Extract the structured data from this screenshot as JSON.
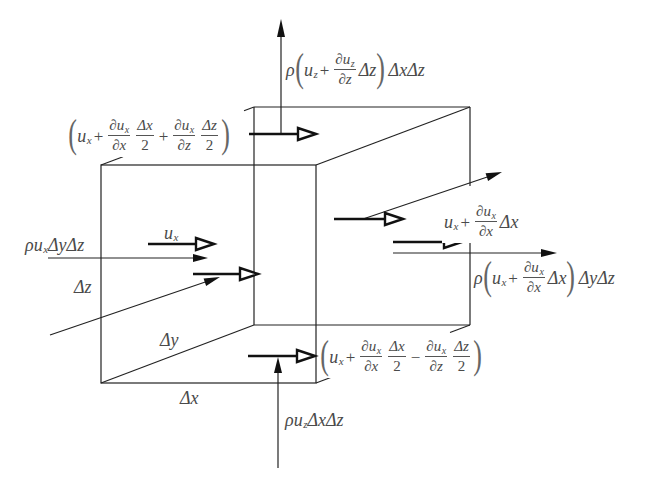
{
  "diagram": {
    "colors": {
      "line": "#222222",
      "text": "#4a4a4a",
      "background": "#ffffff"
    },
    "top_outflow_z": {
      "rho": "ρ",
      "lparen": "(",
      "u": "u",
      "u_sub": "z",
      "plus": "+",
      "frac_num": "∂u",
      "frac_num_sub": "z",
      "frac_den": "∂z",
      "delta": "Δz",
      "rparen": ")",
      "tail": "ΔxΔz"
    },
    "top_face_velocity": {
      "lparen": "(",
      "u": "u",
      "u_sub": "x",
      "plus1": "+",
      "frac1_num": "∂u",
      "frac1_num_sub": "x",
      "frac1_den": "∂x",
      "frac2_num": "Δx",
      "frac2_den": "2",
      "plus2": "+",
      "frac3_num": "∂u",
      "frac3_num_sub": "x",
      "frac3_den": "∂z",
      "frac4_num": "Δz",
      "frac4_den": "2",
      "rparen": ")"
    },
    "inlet_velocity": {
      "u": "u",
      "u_sub": "x"
    },
    "inlet_flux": {
      "head": "ρu",
      "sub": "x",
      "tail": "ΔyΔz"
    },
    "dz_label": "Δz",
    "outlet_velocity": {
      "u": "u",
      "u_sub": "x",
      "plus": "+",
      "frac_num": "∂u",
      "frac_num_sub": "x",
      "frac_den": "∂x",
      "delta": "Δx"
    },
    "outlet_flux": {
      "rho": "ρ",
      "lparen": "(",
      "u": "u",
      "u_sub": "x",
      "plus": "+",
      "frac_num": "∂u",
      "frac_num_sub": "x",
      "frac_den": "∂x",
      "delta": "Δx",
      "rparen": ")",
      "tail": "ΔyΔz"
    },
    "dy_label": "Δy",
    "dx_label": "Δx",
    "bottom_face_velocity": {
      "lparen": "(",
      "u": "u",
      "u_sub": "x",
      "plus": "+",
      "frac1_num": "∂u",
      "frac1_num_sub": "x",
      "frac1_den": "∂x",
      "frac2_num": "Δx",
      "frac2_den": "2",
      "minus": "−",
      "frac3_num": "∂u",
      "frac3_num_sub": "x",
      "frac3_den": "∂z",
      "frac4_num": "Δz",
      "frac4_den": "2",
      "rparen": ")"
    },
    "bottom_inflow_z": {
      "head": "ρu",
      "sub": "z",
      "tail": "ΔxΔz"
    }
  }
}
